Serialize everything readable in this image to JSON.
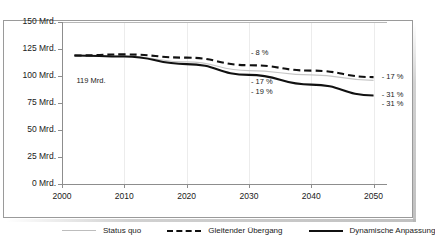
{
  "chart_data": {
    "type": "line",
    "title": "",
    "xlabel": "",
    "ylabel": "",
    "xlim": [
      2000,
      2052
    ],
    "ylim": [
      0,
      150
    ],
    "yticks": [
      0,
      25,
      50,
      75,
      100,
      125,
      150
    ],
    "ytick_labels": [
      "0 Mrd.",
      "25 Mrd.",
      "50 Mrd.",
      "75 Mrd.",
      "100 Mrd.",
      "125 Mrd.",
      "150 Mrd."
    ],
    "xticks": [
      2000,
      2010,
      2020,
      2030,
      2040,
      2050
    ],
    "xtick_labels": [
      "2000",
      "2010",
      "2020",
      "2030",
      "2040",
      "2050"
    ],
    "grid": "vertical-faint",
    "legend_position": "bottom",
    "x": [
      2002,
      2010,
      2020,
      2030,
      2040,
      2050
    ],
    "series": [
      {
        "name": "Status quo",
        "style": "solid-thin-gray",
        "color": "#c6c6c6",
        "values": [
          119,
          118.5,
          113,
          105,
          101,
          96
        ]
      },
      {
        "name": "Gleitender Übergang",
        "style": "dashed-black",
        "color": "#111111",
        "values": [
          119,
          120,
          117,
          110,
          105,
          99
        ]
      },
      {
        "name": "Dynamische Anpassung",
        "style": "solid-black",
        "color": "#111111",
        "values": [
          119,
          118,
          111,
          101,
          92,
          82
        ]
      }
    ],
    "annotations": [
      {
        "id": "start-value",
        "text": "119 Mrd.",
        "x": 2002,
        "y": 95
      },
      {
        "id": "gleitend-2030",
        "text": "- 8 %",
        "x": 2030,
        "y": 121
      },
      {
        "id": "dynamisch-2030",
        "text": "- 17 %",
        "x": 2030,
        "y": 94
      },
      {
        "id": "statusquo-2030",
        "text": "- 19 %",
        "x": 2030,
        "y": 85
      },
      {
        "id": "gleitend-2050",
        "text": "- 17 %",
        "x": 2051,
        "y": 99
      },
      {
        "id": "dynamisch-2050",
        "text": "- 31 %",
        "x": 2051,
        "y": 82
      },
      {
        "id": "statusquo-2050",
        "text": "- 31 %",
        "x": 2051,
        "y": 74
      }
    ]
  },
  "legend": {
    "items": [
      {
        "label": "Status quo"
      },
      {
        "label": "Gleitender Übergang"
      },
      {
        "label": "Dynamische Anpassung"
      }
    ]
  },
  "colors": {
    "status_quo": "#c6c6c6",
    "gleitender_uebergang": "#111111",
    "dynamische_anpassung": "#111111",
    "axis": "#8d8d8d",
    "grid": "#ececec",
    "text": "#1a1a1a"
  }
}
